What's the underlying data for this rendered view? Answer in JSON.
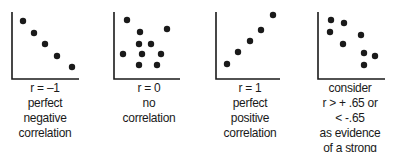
{
  "panels": [
    {
      "id": "negative",
      "axis": {
        "x": 12,
        "top": 12,
        "bottom": 79,
        "right": 79
      },
      "dots": [
        [
          23,
          21
        ],
        [
          34,
          33
        ],
        [
          45,
          44
        ],
        [
          57,
          56
        ],
        [
          72,
          67
        ]
      ],
      "caption_center": 45,
      "caption": [
        "r = –1",
        "perfect",
        "negative",
        "correlation"
      ]
    },
    {
      "id": "none",
      "axis": {
        "x": 114,
        "top": 12,
        "bottom": 79,
        "right": 180
      },
      "dots": [
        [
          127,
          20
        ],
        [
          140,
          32
        ],
        [
          167,
          29
        ],
        [
          139,
          44
        ],
        [
          151,
          44
        ],
        [
          123,
          54
        ],
        [
          142,
          54
        ],
        [
          161,
          54
        ],
        [
          139,
          65
        ],
        [
          157,
          65
        ]
      ],
      "caption_center": 149,
      "caption": [
        "r = 0",
        "no",
        "correlation"
      ]
    },
    {
      "id": "positive",
      "axis": {
        "x": 216,
        "top": 12,
        "bottom": 79,
        "right": 280
      },
      "dots": [
        [
          227,
          64
        ],
        [
          238,
          52
        ],
        [
          250,
          41
        ],
        [
          261,
          30
        ],
        [
          273,
          15
        ]
      ],
      "caption_center": 250,
      "caption": [
        "r = 1",
        "perfect",
        "positive",
        "correlation"
      ]
    },
    {
      "id": "strong",
      "axis": {
        "x": 318,
        "top": 12,
        "bottom": 79,
        "right": 385
      },
      "dots": [
        [
          331,
          20
        ],
        [
          344,
          23
        ],
        [
          330,
          32
        ],
        [
          343,
          44
        ],
        [
          361,
          35
        ],
        [
          364,
          53
        ],
        [
          375,
          56
        ],
        [
          364,
          65
        ]
      ],
      "caption_center": 350,
      "caption": [
        "consider",
        "r > + .65 or",
        "<  -.65",
        "as evidence",
        "of a strong"
      ]
    }
  ],
  "colors": {
    "ink": "#1a1a1a",
    "background": "#ffffff"
  }
}
